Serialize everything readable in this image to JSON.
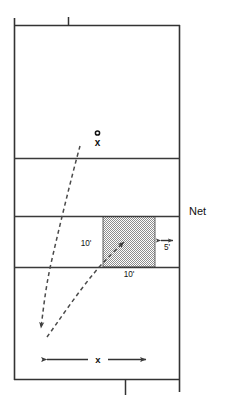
{
  "diagram": {
    "net_label": "Net",
    "player_marker": {
      "circle_label": "o",
      "cross_label": "x"
    },
    "dimensions": {
      "depth_10ft": "10'",
      "width_10ft": "10'",
      "sideline_5ft": "5'",
      "variable_x": "x"
    },
    "colors": {
      "line": "#333333",
      "shade_fill": "#b8b8b8",
      "dash": "#4a4a4a",
      "text": "#111111"
    },
    "court": {
      "left": 14,
      "right": 180,
      "top": 25,
      "bottom": 380,
      "service_lines_y": [
        158,
        216,
        267
      ],
      "center_mark_x": 68,
      "bottom_center_mark_x": 125
    },
    "target_box": {
      "left": 103,
      "right": 155,
      "top": 216,
      "bottom": 267
    }
  }
}
